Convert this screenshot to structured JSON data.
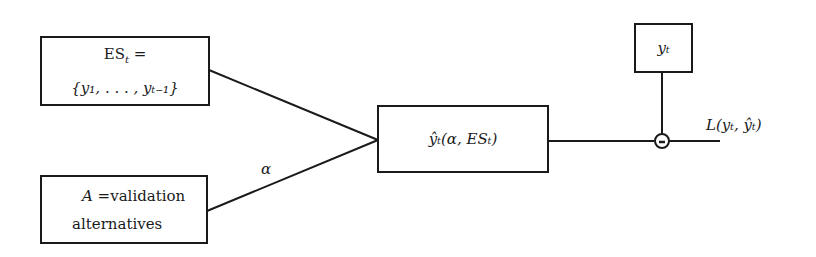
{
  "diagram": {
    "type": "block-diagram",
    "nodes": {
      "estimation_set": {
        "line1": "ES",
        "line1_sub": "t",
        "line1_suffix": " =",
        "line2": "{y₁, . . . , yₜ₋₁}"
      },
      "alternatives": {
        "line1_math": "A",
        "line1_rest": " =validation",
        "line2": "alternatives"
      },
      "predictor": {
        "text": "ŷₜ(α, ESₜ)"
      },
      "observed": {
        "text": "yₜ"
      },
      "comparator": {
        "symbol": "−"
      }
    },
    "edge_labels": {
      "alpha": "α",
      "loss": "L(yₜ, ŷₜ)"
    },
    "edges": [
      {
        "from": "estimation_set",
        "to": "predictor"
      },
      {
        "from": "alternatives",
        "to": "predictor",
        "label": "α"
      },
      {
        "from": "predictor",
        "to": "comparator"
      },
      {
        "from": "observed",
        "to": "comparator"
      },
      {
        "from": "comparator",
        "to": "output",
        "label": "L(yₜ, ŷₜ)"
      }
    ],
    "colors": {
      "stroke": "#1a1a1a",
      "background": "#ffffff"
    }
  }
}
